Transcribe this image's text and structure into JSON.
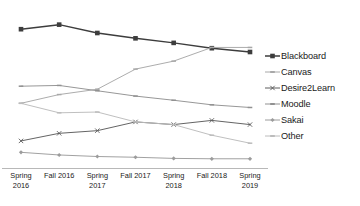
{
  "chart_data": {
    "type": "line",
    "title": "",
    "subtitle": "",
    "xlabel": "",
    "ylabel": "",
    "grid": false,
    "legend_position": "right",
    "categories": [
      "Spring 2016",
      "Fall 2016",
      "Spring 2017",
      "Fall 2017",
      "Spring 2018",
      "Fall 2018",
      "Spring 2019"
    ],
    "category_lines": [
      [
        "Spring",
        "2016"
      ],
      [
        "Fall 2016",
        ""
      ],
      [
        "Spring",
        "2017"
      ],
      [
        "Fall 2017",
        ""
      ],
      [
        "Spring",
        "2018"
      ],
      [
        "Fall 2018",
        ""
      ],
      [
        "Spring",
        "2019"
      ]
    ],
    "ylim": [
      0,
      40
    ],
    "yaxis_visible": false,
    "series": [
      {
        "name": "Blackboard",
        "color": "#3d3d3d",
        "marker": "square",
        "values": [
          36.0,
          37.2,
          35.0,
          33.6,
          32.4,
          31.0,
          30.0
        ]
      },
      {
        "name": "Canvas",
        "color": "#a8a8a8",
        "marker": "dash",
        "values": [
          16.5,
          18.8,
          20.2,
          25.5,
          27.6,
          31.2,
          31.2
        ]
      },
      {
        "name": "Desire2Learn",
        "color": "#5c5c5c",
        "marker": "x",
        "values": [
          6.6,
          8.6,
          9.3,
          11.6,
          10.9,
          12.0,
          10.9
        ]
      },
      {
        "name": "Moodle",
        "color": "#919191",
        "marker": "dash",
        "values": [
          21.0,
          21.2,
          19.8,
          18.4,
          17.3,
          16.1,
          15.4
        ]
      },
      {
        "name": "Sakai",
        "color": "#9c9c9c",
        "marker": "diamond",
        "values": [
          3.6,
          2.9,
          2.5,
          2.3,
          2.0,
          1.9,
          1.9
        ]
      },
      {
        "name": "Other",
        "color": "#bcbcbc",
        "marker": "dash",
        "values": [
          16.5,
          14.0,
          14.2,
          11.6,
          10.9,
          8.1,
          6.0
        ]
      }
    ]
  },
  "legend": {
    "items": [
      {
        "label": "Blackboard"
      },
      {
        "label": "Canvas"
      },
      {
        "label": "Desire2Learn"
      },
      {
        "label": "Moodle"
      },
      {
        "label": "Sakai"
      },
      {
        "label": "Other"
      }
    ]
  },
  "axis": {
    "baseline_color": "#b0b0b0"
  }
}
